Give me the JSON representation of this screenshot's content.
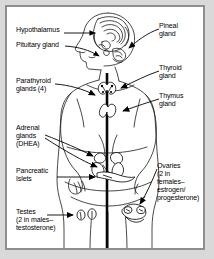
{
  "figure": {
    "type": "anatomical-diagram",
    "border_color": "#8e8e8e",
    "background_color": "#ffffff",
    "page_background": "#d9d9d9",
    "ink_color": "#000000"
  },
  "labels": {
    "hypothalamus": "Hypothalamus",
    "pituitary": "Pituitary gland",
    "parathyroid_l1": "Parathyroid",
    "parathyroid_l2": "glands (4)",
    "adrenal_l1": "Adrenal",
    "adrenal_l2": "glands",
    "adrenal_l3": "(DHEA)",
    "pancreatic_l1": "Pancreatic",
    "pancreatic_l2": "Islets",
    "testes_l1": "Testes",
    "testes_l2": "(2 in males–",
    "testes_l3": "testosterone)",
    "pineal_l1": "Pineal",
    "pineal_l2": "gland",
    "thyroid_l1": "Thyroid",
    "thyroid_l2": "gland",
    "thymus_l1": "Thymus",
    "thymus_l2": "gland",
    "ovaries_l1": "Ovaries",
    "ovaries_l2": "(2 in",
    "ovaries_l3": "females–",
    "ovaries_l4": "estrogen/",
    "ovaries_l5": "progesterone)"
  },
  "structures": [
    {
      "name": "hypothalamus",
      "side": "left"
    },
    {
      "name": "pituitary-gland",
      "side": "left"
    },
    {
      "name": "parathyroid-glands",
      "side": "left"
    },
    {
      "name": "adrenal-glands",
      "side": "left"
    },
    {
      "name": "pancreatic-islets",
      "side": "left"
    },
    {
      "name": "testes",
      "side": "left"
    },
    {
      "name": "pineal-gland",
      "side": "right"
    },
    {
      "name": "thyroid-gland",
      "side": "right"
    },
    {
      "name": "thymus-gland",
      "side": "right"
    },
    {
      "name": "ovaries",
      "side": "right"
    }
  ]
}
